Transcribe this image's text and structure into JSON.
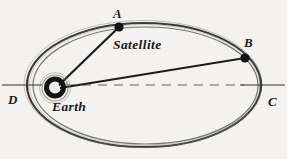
{
  "diagram": {
    "background_color": "#f4f3f1",
    "ink_color": "#222222",
    "labels": {
      "point_a": "A",
      "point_b": "B",
      "point_c": "C",
      "point_d": "D",
      "satellite": "Satellite",
      "earth": "Earth"
    },
    "geometry": {
      "ellipse": {
        "center_x": 144,
        "center_y": 85,
        "radius_x": 117,
        "radius_y": 62
      },
      "earth": {
        "center_x": 55,
        "center_y": 88,
        "outer_radius": 11,
        "inner_radius": 5
      },
      "point_a": {
        "x": 119,
        "y": 27
      },
      "point_b": {
        "x": 245,
        "y": 58
      },
      "point_c": {
        "x": 261,
        "y": 85
      },
      "point_d": {
        "x": 27,
        "y": 85
      },
      "axis": {
        "x1": 2,
        "x2": 285,
        "y": 85
      }
    }
  }
}
